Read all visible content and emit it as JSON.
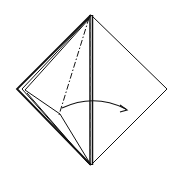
{
  "diagram": {
    "type": "origami-fold-step",
    "colors": {
      "background": "#ffffff",
      "line": "#111111"
    },
    "shape": {
      "top": [
        91,
        15
      ],
      "left": [
        17,
        89
      ],
      "right": [
        167,
        89
      ],
      "bottom": [
        91,
        165
      ]
    },
    "fold_line": {
      "style": "dash-dot",
      "from": [
        89,
        18
      ],
      "to": [
        59,
        115
      ]
    },
    "arrow": {
      "from": [
        62,
        108
      ],
      "to": [
        128,
        111
      ],
      "direction": "right"
    }
  }
}
